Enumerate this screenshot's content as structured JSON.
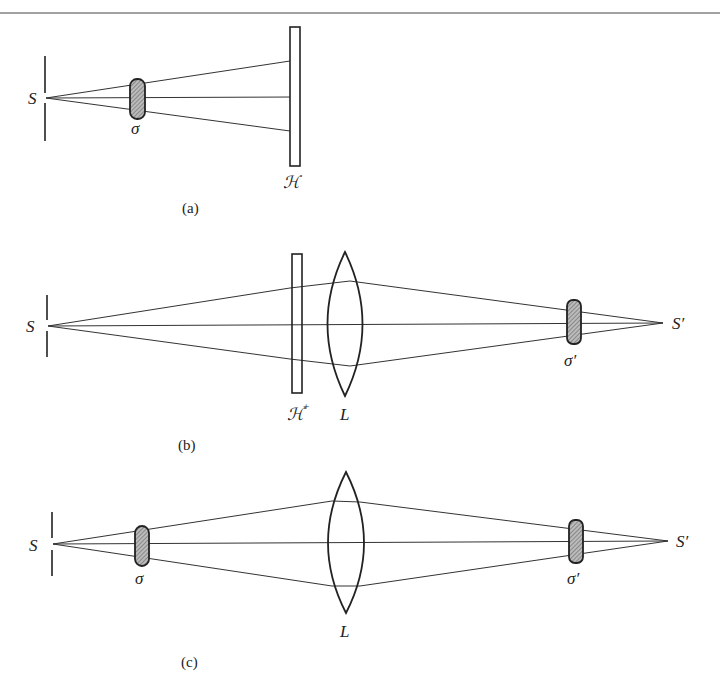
{
  "figure": {
    "panels": [
      {
        "id": "a",
        "caption": "(a)",
        "source_label": "S",
        "aperture_label": "σ",
        "plate_label": "ℋ"
      },
      {
        "id": "b",
        "caption": "(b)",
        "source_label": "S",
        "plate_label": "ℋ",
        "plate_superscript": "+",
        "lens_label": "L",
        "image_aperture_label": "σ′",
        "image_label": "S′"
      },
      {
        "id": "c",
        "caption": "(c)",
        "source_label": "S",
        "aperture_label": "σ",
        "lens_label": "L",
        "image_aperture_label": "σ′",
        "image_label": "S′"
      }
    ]
  }
}
